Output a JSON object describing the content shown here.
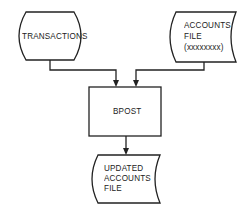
{
  "diagram": {
    "type": "system-flowchart",
    "nodes": [
      {
        "id": "transactions",
        "shape": "terminal",
        "lines": [
          "TRANSACTIONS"
        ]
      },
      {
        "id": "accounts_file",
        "shape": "stored-data",
        "lines": [
          "ACCOUNTS",
          "FILE",
          "(xxxxxxxx)"
        ]
      },
      {
        "id": "bpost",
        "shape": "process",
        "lines": [
          "BPOST"
        ]
      },
      {
        "id": "updated_accounts_file",
        "shape": "stored-data",
        "lines": [
          "UPDATED",
          "ACCOUNTS",
          "FILE"
        ]
      }
    ],
    "edges": [
      {
        "from": "transactions",
        "to": "bpost"
      },
      {
        "from": "accounts_file",
        "to": "bpost"
      },
      {
        "from": "bpost",
        "to": "updated_accounts_file"
      }
    ],
    "colors": {
      "stroke": "#222222",
      "background": "#ffffff"
    }
  }
}
